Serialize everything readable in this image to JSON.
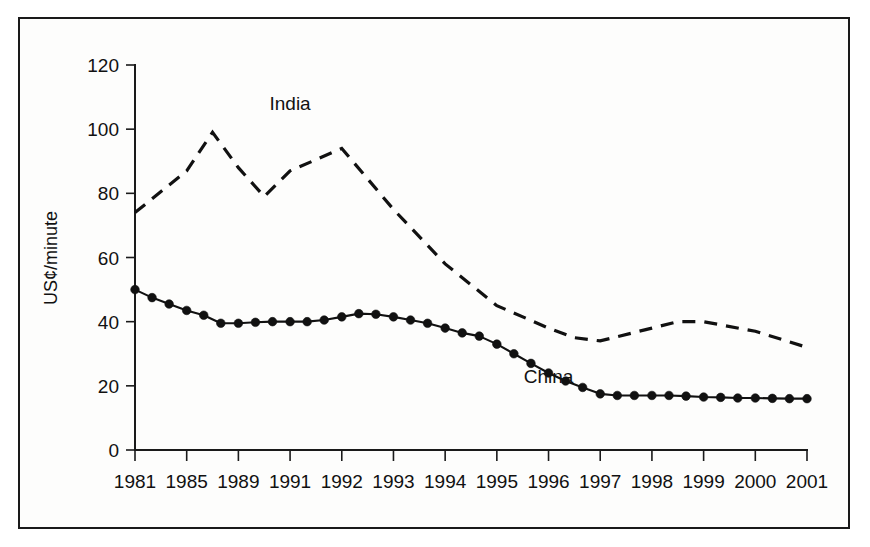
{
  "chart_data": {
    "type": "line",
    "title": "",
    "subtitle": "",
    "xlabel": "",
    "ylabel": "US¢/minute",
    "ylim": [
      0,
      120
    ],
    "yticks": [
      0,
      20,
      40,
      60,
      80,
      100,
      120
    ],
    "ytick_labels": [
      "0",
      "20",
      "40",
      "60",
      "80",
      "100",
      "120"
    ],
    "grid": false,
    "legend_position": "inline-annotation",
    "categories": [
      "1981",
      "1985",
      "1989",
      "1991",
      "1992",
      "1993",
      "1994",
      "1995",
      "1996",
      "1997",
      "1998",
      "1999",
      "2000",
      "2001"
    ],
    "annotations": [
      {
        "text": "India",
        "x_category": "1991",
        "y_value": 106
      },
      {
        "text": "China",
        "x_category": "1996",
        "y_value": 21
      }
    ],
    "series": [
      {
        "name": "India",
        "style": "dashed",
        "markers": false,
        "x": [
          0,
          1,
          1.5,
          2,
          2.5,
          3,
          4,
          5,
          6,
          7,
          8,
          8.5,
          9,
          10,
          10.5,
          11,
          12,
          13
        ],
        "values": [
          74,
          87,
          99,
          88,
          79,
          87,
          94,
          75,
          58,
          45,
          38,
          35,
          34,
          38,
          40,
          40,
          37,
          32
        ]
      },
      {
        "name": "China",
        "style": "solid",
        "markers": true,
        "x": [
          0,
          0.33,
          0.66,
          1,
          1.33,
          1.66,
          2,
          2.33,
          2.66,
          3,
          3.33,
          3.66,
          4,
          4.33,
          4.66,
          5,
          5.33,
          5.66,
          6,
          6.33,
          6.66,
          7,
          7.33,
          7.66,
          8,
          8.33,
          8.66,
          9,
          9.33,
          9.66,
          10,
          10.33,
          10.66,
          11,
          11.33,
          11.66,
          12,
          12.33,
          12.66,
          13
        ],
        "values": [
          50,
          47.5,
          45.5,
          43.5,
          42,
          39.5,
          39.5,
          39.8,
          40,
          40,
          40,
          40.5,
          41.5,
          42.5,
          42.3,
          41.5,
          40.5,
          39.5,
          38,
          36.5,
          35.5,
          33,
          30,
          27,
          24,
          21.5,
          19.5,
          17.5,
          17,
          17,
          17,
          17,
          16.8,
          16.5,
          16.4,
          16.2,
          16.2,
          16.1,
          16,
          16
        ]
      }
    ]
  },
  "figure": {
    "border_color": "#1a1a1a",
    "background_color": "#ffffff",
    "line_color": "#111111"
  }
}
